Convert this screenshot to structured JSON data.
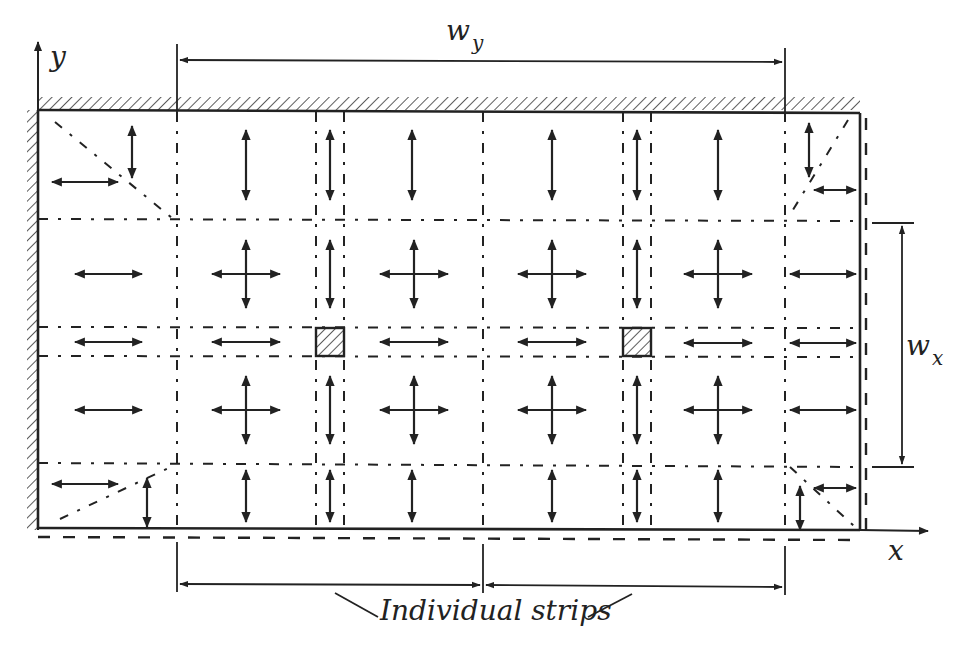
{
  "diagram": {
    "type": "strip-method slab diagram",
    "colors": {
      "ink": "#222222",
      "background": "#ffffff",
      "hatch": "#333333"
    },
    "axes": {
      "x_label": "x",
      "y_label": "y"
    },
    "dimensions": {
      "wy": {
        "main": "w",
        "subscript": "y"
      },
      "wx": {
        "main": "w",
        "subscript": "x"
      }
    },
    "caption": "Individual strips",
    "supports": [
      "top edge (fixed, hatched)",
      "left edge (fixed, hatched)",
      "right edge (free, dashed)",
      "bottom edge (free, dashed)"
    ],
    "columns_count": 2,
    "arrow_types": [
      "horizontal-double",
      "vertical-double",
      "cross"
    ]
  }
}
